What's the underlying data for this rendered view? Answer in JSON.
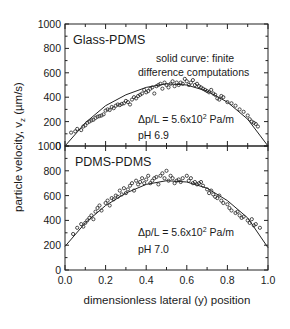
{
  "chart_data": {
    "type": "scatter",
    "title": "",
    "xlabel": "dimensionless lateral (y) position",
    "ylabel": "particle velocity, v_z (µm/s)",
    "ylabel_display": "particle velocity, v",
    "ylabel_sub": "z",
    "ylabel_tail": " (µm/s)",
    "xlim": [
      0.0,
      1.0
    ],
    "x_ticks": [
      "0.0",
      "0.2",
      "0.4",
      "0.6",
      "0.8",
      "1.0"
    ],
    "grid": false,
    "panels": [
      {
        "name": "Glass-PDMS",
        "label": "Glass-PDMS",
        "ylim": [
          0,
          1000
        ],
        "y_ticks": [
          "0",
          "200",
          "400",
          "600",
          "800",
          "1000"
        ],
        "annotations": [
          "solid curve: finite",
          "difference computations",
          "Δp/L = 5.6x10² Pa/m",
          "pH 6.9"
        ],
        "annotation_parts": {
          "line1": "solid curve: finite",
          "line2": "difference computations",
          "dp_prefix": "Δp/L = 5.6x10",
          "dp_exp": "2",
          "dp_unit": " Pa/m",
          "ph": "pH 6.9"
        },
        "curve": {
          "x": [
            0.0,
            0.1,
            0.2,
            0.3,
            0.4,
            0.5,
            0.6,
            0.7,
            0.8,
            0.9,
            1.0
          ],
          "y": [
            0,
            190,
            330,
            420,
            480,
            510,
            500,
            450,
            360,
            220,
            0
          ]
        },
        "points": {
          "x": [
            0.03,
            0.05,
            0.06,
            0.08,
            0.09,
            0.1,
            0.11,
            0.12,
            0.13,
            0.14,
            0.15,
            0.16,
            0.17,
            0.18,
            0.19,
            0.2,
            0.21,
            0.22,
            0.23,
            0.24,
            0.25,
            0.26,
            0.27,
            0.28,
            0.29,
            0.3,
            0.31,
            0.32,
            0.33,
            0.34,
            0.35,
            0.36,
            0.37,
            0.38,
            0.39,
            0.4,
            0.41,
            0.42,
            0.43,
            0.44,
            0.45,
            0.46,
            0.47,
            0.48,
            0.49,
            0.5,
            0.51,
            0.52,
            0.53,
            0.54,
            0.55,
            0.56,
            0.57,
            0.58,
            0.59,
            0.6,
            0.61,
            0.62,
            0.63,
            0.64,
            0.65,
            0.66,
            0.67,
            0.68,
            0.69,
            0.7,
            0.71,
            0.72,
            0.73,
            0.74,
            0.75,
            0.76,
            0.77,
            0.78,
            0.8,
            0.82,
            0.84,
            0.86,
            0.88,
            0.9,
            0.91,
            0.92,
            0.93,
            0.94,
            0.95
          ],
          "y": [
            110,
            120,
            140,
            130,
            160,
            170,
            190,
            200,
            210,
            215,
            230,
            240,
            245,
            250,
            260,
            290,
            300,
            295,
            320,
            310,
            330,
            340,
            335,
            345,
            350,
            370,
            360,
            340,
            380,
            400,
            390,
            410,
            420,
            430,
            460,
            440,
            450,
            470,
            480,
            430,
            490,
            500,
            510,
            470,
            520,
            500,
            480,
            510,
            530,
            490,
            520,
            500,
            520,
            510,
            550,
            530,
            500,
            520,
            540,
            500,
            510,
            490,
            480,
            470,
            460,
            450,
            440,
            460,
            430,
            420,
            390,
            380,
            410,
            400,
            360,
            350,
            330,
            300,
            280,
            250,
            220,
            200,
            190,
            180,
            160
          ]
        }
      },
      {
        "name": "PDMS-PDMS",
        "label": "PDMS-PDMS",
        "ylim": [
          0,
          1000
        ],
        "y_ticks": [
          "0",
          "200",
          "400",
          "600",
          "800",
          "1000"
        ],
        "annotations": [
          "Δp/L = 5.6x10² Pa/m",
          "pH 7.0"
        ],
        "annotation_parts": {
          "dp_prefix": "Δp/L = 5.6x10",
          "dp_exp": "2",
          "dp_unit": " Pa/m",
          "ph": "pH 7.0"
        },
        "curve": {
          "x": [
            0.0,
            0.1,
            0.2,
            0.3,
            0.4,
            0.5,
            0.6,
            0.7,
            0.8,
            0.9,
            1.0
          ],
          "y": [
            190,
            380,
            520,
            620,
            690,
            720,
            710,
            660,
            560,
            420,
            180
          ]
        },
        "points": {
          "x": [
            0.04,
            0.06,
            0.08,
            0.09,
            0.1,
            0.11,
            0.12,
            0.13,
            0.14,
            0.15,
            0.16,
            0.17,
            0.18,
            0.2,
            0.21,
            0.22,
            0.23,
            0.24,
            0.25,
            0.26,
            0.27,
            0.28,
            0.29,
            0.3,
            0.31,
            0.32,
            0.33,
            0.34,
            0.35,
            0.36,
            0.37,
            0.38,
            0.39,
            0.4,
            0.41,
            0.42,
            0.43,
            0.44,
            0.45,
            0.46,
            0.47,
            0.48,
            0.49,
            0.5,
            0.51,
            0.52,
            0.53,
            0.54,
            0.55,
            0.56,
            0.57,
            0.58,
            0.6,
            0.61,
            0.62,
            0.63,
            0.64,
            0.65,
            0.66,
            0.67,
            0.68,
            0.7,
            0.71,
            0.72,
            0.73,
            0.74,
            0.75,
            0.76,
            0.77,
            0.78,
            0.8,
            0.81,
            0.82,
            0.84,
            0.85,
            0.86,
            0.87,
            0.88,
            0.9,
            0.91,
            0.92,
            0.93,
            0.94,
            0.96
          ],
          "y": [
            290,
            340,
            370,
            350,
            380,
            400,
            420,
            440,
            410,
            470,
            500,
            520,
            480,
            540,
            560,
            520,
            580,
            570,
            600,
            590,
            640,
            610,
            660,
            620,
            650,
            680,
            700,
            640,
            720,
            690,
            710,
            740,
            700,
            730,
            760,
            700,
            720,
            740,
            750,
            690,
            760,
            780,
            740,
            800,
            720,
            760,
            740,
            700,
            720,
            730,
            710,
            740,
            760,
            720,
            740,
            700,
            710,
            690,
            700,
            710,
            680,
            650,
            620,
            640,
            610,
            590,
            580,
            600,
            560,
            540,
            530,
            500,
            480,
            460,
            470,
            440,
            420,
            430,
            400,
            380,
            410,
            360,
            370,
            340
          ]
        }
      }
    ]
  }
}
